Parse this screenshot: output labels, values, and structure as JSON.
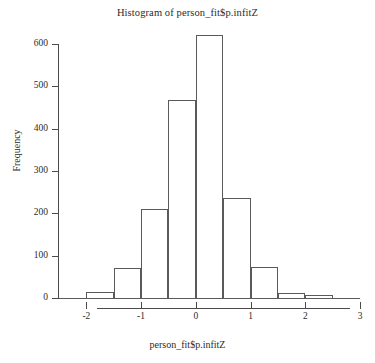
{
  "chart_data": {
    "type": "bar",
    "title": "Histogram of person_fit$p.infitZ",
    "xlabel": "person_fit$p.infitZ",
    "ylabel": "Frequency",
    "grid": false,
    "legend": null,
    "xlim": [
      -2.5,
      3.0
    ],
    "ylim": [
      0,
      630
    ],
    "bin_width": 0.5,
    "bin_edges": [
      -2.0,
      -1.5,
      -1.0,
      -0.5,
      0.0,
      0.5,
      1.0,
      1.5,
      2.0,
      2.5
    ],
    "categories": [
      "-2.0 to -1.5",
      "-1.5 to -1.0",
      "-1.0 to -0.5",
      "-0.5 to 0.0",
      "0.0 to 0.5",
      "0.5 to 1.0",
      "1.0 to 1.5",
      "1.5 to 2.0",
      "2.0 to 2.5"
    ],
    "values": [
      15,
      70,
      210,
      467,
      622,
      236,
      73,
      11,
      8
    ],
    "x_ticks": [
      -2,
      -1,
      0,
      1,
      2,
      3
    ],
    "x_tick_labels": [
      "-2",
      "-1",
      "0",
      "1",
      "2",
      "3"
    ],
    "y_ticks": [
      0,
      100,
      200,
      300,
      400,
      500,
      600
    ],
    "y_tick_labels": [
      "0",
      "100",
      "200",
      "300",
      "400",
      "500",
      "600"
    ],
    "bar_edge_color": "#5a5a5a",
    "bar_fill_color": "transparent",
    "axis_color": "#4a4a4a",
    "background_color": "#ffffff"
  }
}
